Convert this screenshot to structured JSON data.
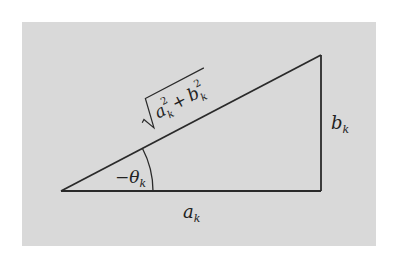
{
  "figure": {
    "type": "right-triangle",
    "background_color": "#d9d9d9",
    "line_color": "#2a2a2a",
    "labels": {
      "hypotenuse": "√(a_k² + b_k²)",
      "hypotenuse_parts": {
        "a": "a",
        "a_sub": "k",
        "a_sup": "2",
        "plus": "+",
        "b": "b",
        "b_sub": "k",
        "b_sup": "2"
      },
      "angle": {
        "prefix": "−θ",
        "sub": "k"
      },
      "adjacent": {
        "base": "a",
        "sub": "k"
      },
      "opposite": {
        "base": "b",
        "sub": "k"
      }
    }
  }
}
